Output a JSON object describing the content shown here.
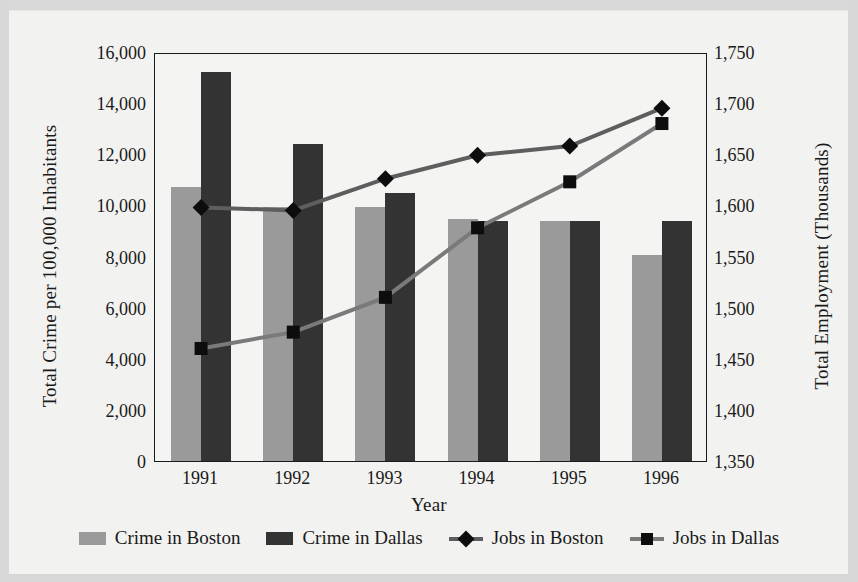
{
  "axes": {
    "x_title": "Year",
    "y_left_title": "Total Crime per 100,000 Inhabitants",
    "y_right_title": "Total Employment (Thousands)"
  },
  "ticks": {
    "left": [
      "16,000",
      "14,000",
      "12,000",
      "10,000",
      "8,000",
      "6,000",
      "4,000",
      "2,000",
      "0"
    ],
    "right": [
      "1,750",
      "1,700",
      "1,650",
      "1,600",
      "1,550",
      "1,500",
      "1,450",
      "1,400",
      "1,350"
    ],
    "x": [
      "1991",
      "1992",
      "1993",
      "1994",
      "1995",
      "1996"
    ]
  },
  "legend": {
    "items": [
      {
        "label": "Crime in Boston",
        "marker": "bar-swatch-light"
      },
      {
        "label": "Crime in Dallas",
        "marker": "bar-swatch-dark"
      },
      {
        "label": "Jobs in Boston",
        "marker": "line-diamond"
      },
      {
        "label": "Jobs in Dallas",
        "marker": "line-square"
      }
    ]
  },
  "colors": {
    "crime_boston": "#9a9a9a",
    "crime_dallas": "#333333",
    "jobs_boston_line": "#5e5e5e",
    "jobs_dallas_line": "#7a7a7a",
    "marker": "#0d0d0d",
    "axis": "#1a1a1a",
    "background": "#f2f2f0"
  },
  "chart_data": {
    "type": "bar",
    "title": "",
    "xlabel": "Year",
    "ylabel": "Total Crime per 100,000 Inhabitants",
    "y2label": "Total Employment (Thousands)",
    "categories": [
      "1991",
      "1992",
      "1993",
      "1994",
      "1995",
      "1996"
    ],
    "ylim": [
      0,
      16000
    ],
    "y2lim": [
      1350,
      1750
    ],
    "ytick_step": 2000,
    "y2tick_step": 50,
    "grid": false,
    "legend_position": "bottom",
    "series": [
      {
        "name": "Crime in Boston",
        "type": "bar",
        "axis": "left",
        "values": [
          10700,
          9950,
          9950,
          9450,
          9400,
          8050
        ]
      },
      {
        "name": "Crime in Dallas",
        "type": "bar",
        "axis": "left",
        "values": [
          15200,
          12400,
          10500,
          9400,
          9400,
          9400
        ]
      },
      {
        "name": "Jobs in Boston",
        "type": "line",
        "axis": "right",
        "marker": "diamond",
        "values": [
          1600,
          1597,
          1628,
          1651,
          1660,
          1697
        ]
      },
      {
        "name": "Jobs in Dallas",
        "type": "line",
        "axis": "right",
        "marker": "square",
        "values": [
          1462,
          1478,
          1512,
          1580,
          1625,
          1682
        ]
      }
    ]
  }
}
